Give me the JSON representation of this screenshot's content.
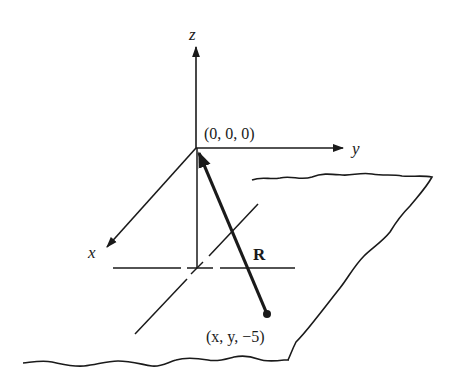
{
  "figure": {
    "type": "3d-coordinate-diagram",
    "axes": {
      "z_label": "z",
      "y_label": "y",
      "x_label": "x"
    },
    "points": {
      "origin_label": "(0, 0, 0)",
      "point_label": "(x, y, −5)"
    },
    "vector": {
      "label": "R",
      "from": "(x, y, −5)",
      "to": "(0, 0, 0)"
    },
    "plane": {
      "description": "plane z = -5 drawn as torn sheet with wavy edges"
    },
    "colors": {
      "ink": "#1a1a1a",
      "background": "#ffffff"
    }
  }
}
